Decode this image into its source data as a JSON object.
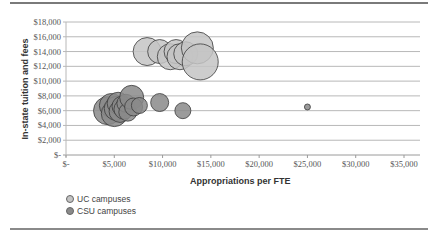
{
  "chart_data": {
    "type": "scatter",
    "subtype": "bubble",
    "title": "",
    "xlabel": "Appropriations per FTE",
    "ylabel": "In-state tuition and fees",
    "xlim": [
      0,
      35000
    ],
    "ylim": [
      0,
      18000
    ],
    "x_ticks": [
      "$-",
      "$5,000",
      "$10,000",
      "$15,000",
      "$20,000",
      "$25,000",
      "$30,000",
      "$35,000"
    ],
    "y_ticks": [
      "$-",
      "$2,000",
      "$4,000",
      "$6,000",
      "$8,000",
      "$10,000",
      "$12,000",
      "$14,000",
      "$16,000",
      "$18,000"
    ],
    "grid": {
      "horizontal": true,
      "vertical": false
    },
    "legend_position": "bottom-left",
    "series": [
      {
        "name": "UC campuses",
        "color": "#c4c4c4",
        "points": [
          {
            "x": 8400,
            "y": 14000,
            "size": 14
          },
          {
            "x": 9700,
            "y": 14000,
            "size": 12
          },
          {
            "x": 10800,
            "y": 13300,
            "size": 13
          },
          {
            "x": 11400,
            "y": 14000,
            "size": 12
          },
          {
            "x": 11800,
            "y": 13300,
            "size": 13
          },
          {
            "x": 12400,
            "y": 13700,
            "size": 12
          },
          {
            "x": 13600,
            "y": 14500,
            "size": 16
          },
          {
            "x": 13900,
            "y": 12600,
            "size": 18
          }
        ]
      },
      {
        "name": "CSU campuses",
        "color": "#8a8a8a",
        "points": [
          {
            "x": 4300,
            "y": 6000,
            "size": 14
          },
          {
            "x": 4700,
            "y": 6700,
            "size": 12
          },
          {
            "x": 5000,
            "y": 5600,
            "size": 13
          },
          {
            "x": 5200,
            "y": 6300,
            "size": 12
          },
          {
            "x": 5400,
            "y": 7000,
            "size": 11
          },
          {
            "x": 5600,
            "y": 5900,
            "size": 11
          },
          {
            "x": 5800,
            "y": 6600,
            "size": 10
          },
          {
            "x": 6000,
            "y": 6200,
            "size": 10
          },
          {
            "x": 6200,
            "y": 7000,
            "size": 9
          },
          {
            "x": 6400,
            "y": 5800,
            "size": 9
          },
          {
            "x": 6800,
            "y": 7800,
            "size": 12
          },
          {
            "x": 7000,
            "y": 6500,
            "size": 9
          },
          {
            "x": 7600,
            "y": 6700,
            "size": 8
          },
          {
            "x": 9700,
            "y": 7100,
            "size": 9
          },
          {
            "x": 12100,
            "y": 6000,
            "size": 8
          },
          {
            "x": 25000,
            "y": 6500,
            "size": 3
          }
        ]
      }
    ]
  },
  "legend": {
    "items": [
      {
        "label": "UC campuses",
        "color": "#c4c4c4"
      },
      {
        "label": "CSU campuses",
        "color": "#8a8a8a"
      }
    ]
  }
}
